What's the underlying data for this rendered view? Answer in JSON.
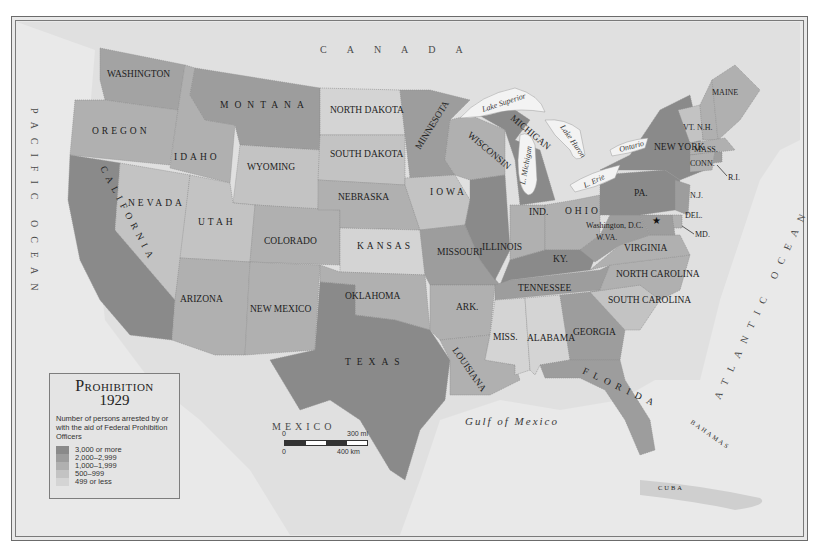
{
  "legend": {
    "title": "Prohibition",
    "year": "1929",
    "description": "Number of persons arrested by or with the aid of Federal Prohibition Officers",
    "categories": [
      {
        "label": "3,000 or more",
        "color": "#8a8a8a"
      },
      {
        "label": "2,000–2,999",
        "color": "#9d9d9d"
      },
      {
        "label": "1,000–1,999",
        "color": "#b0b0b0"
      },
      {
        "label": "500–999",
        "color": "#c3c3c3"
      },
      {
        "label": "499 or less",
        "color": "#d4d4d4"
      }
    ]
  },
  "scale_bar": {
    "mi_zero": "0",
    "mi_label": "300 mi",
    "km_zero": "0",
    "km_label": "400 km"
  },
  "regions": {
    "canada": "CANADA",
    "mexico": "MEXICO",
    "pacific": "PACIFIC OCEAN",
    "atlantic": "ATLANTIC OCEAN",
    "gulf": "Gulf of Mexico",
    "bahamas": "BAHAMAS",
    "cuba": "CUBA"
  },
  "lakes": {
    "superior": "Lake Superior",
    "michigan": "L. Michigan",
    "huron": "Lake Huron",
    "erie": "L. Erie",
    "ontario": "Ontario"
  },
  "states": {
    "washington": {
      "label": "WASHINGTON",
      "category": "2,000–2,999"
    },
    "oregon": {
      "label": "OREGON",
      "category": "1,000–1,999"
    },
    "california": {
      "label": "CALIFORNIA",
      "category": "3,000 or more"
    },
    "idaho": {
      "label": "IDAHO",
      "category": "1,000–1,999"
    },
    "nevada": {
      "label": "NEVADA",
      "category": "500–999"
    },
    "montana": {
      "label": "MONTANA",
      "category": "2,000–2,999"
    },
    "wyoming": {
      "label": "WYOMING",
      "category": "500–999"
    },
    "utah": {
      "label": "UTAH",
      "category": "500–999"
    },
    "arizona": {
      "label": "ARIZONA",
      "category": "1,000–1,999"
    },
    "colorado": {
      "label": "COLORADO",
      "category": "1,000–1,999"
    },
    "new_mexico": {
      "label": "NEW MEXICO",
      "category": "1,000–1,999"
    },
    "north_dakota": {
      "label": "NORTH DAKOTA",
      "category": "499 or less"
    },
    "south_dakota": {
      "label": "SOUTH DAKOTA",
      "category": "500–999"
    },
    "nebraska": {
      "label": "NEBRASKA",
      "category": "1,000–1,999"
    },
    "kansas": {
      "label": "KANSAS",
      "category": "499 or less"
    },
    "oklahoma": {
      "label": "OKLAHOMA",
      "category": "1,000–1,999"
    },
    "texas": {
      "label": "TEXAS",
      "category": "3,000 or more"
    },
    "minnesota": {
      "label": "MINNESOTA",
      "category": "2,000–2,999"
    },
    "iowa": {
      "label": "IOWA",
      "category": "500–999"
    },
    "missouri": {
      "label": "MISSOURI",
      "category": "2,000–2,999"
    },
    "arkansas": {
      "label": "ARK.",
      "category": "1,000–1,999"
    },
    "louisiana": {
      "label": "LOUISIANA",
      "category": "1,000–1,999"
    },
    "wisconsin": {
      "label": "WISCONSIN",
      "category": "1,000–1,999"
    },
    "illinois": {
      "label": "ILLINOIS",
      "category": "3,000 or more"
    },
    "michigan": {
      "label": "MICHIGAN",
      "category": "3,000 or more"
    },
    "indiana": {
      "label": "IND.",
      "category": "1,000–1,999"
    },
    "ohio": {
      "label": "OHIO",
      "category": "1,000–1,999"
    },
    "kentucky": {
      "label": "KY.",
      "category": "3,000 or more"
    },
    "tennessee": {
      "label": "TENNESSEE",
      "category": "2,000–2,999"
    },
    "mississippi": {
      "label": "MISS.",
      "category": "499 or less"
    },
    "alabama": {
      "label": "ALABAMA",
      "category": "499 or less"
    },
    "georgia": {
      "label": "GEORGIA",
      "category": "2,000–2,999"
    },
    "florida": {
      "label": "FLORIDA",
      "category": "2,000–2,999"
    },
    "south_carolina": {
      "label": "SOUTH CAROLINA",
      "category": "500–999"
    },
    "north_carolina": {
      "label": "NORTH CAROLINA",
      "category": "1,000–1,999"
    },
    "virginia": {
      "label": "VIRGINIA",
      "category": "1,000–1,999"
    },
    "west_virginia": {
      "label": "W.VA.",
      "category": "2,000–2,999"
    },
    "pennsylvania": {
      "label": "PA.",
      "category": "3,000 or more"
    },
    "new_york": {
      "label": "NEW YORK",
      "category": "3,000 or more"
    },
    "new_jersey": {
      "label": "N.J.",
      "category": "2,000–2,999"
    },
    "delaware": {
      "label": "DEL.",
      "category": "1,000–1,999"
    },
    "maryland": {
      "label": "MD.",
      "category": "2,000–2,999"
    },
    "vermont": {
      "label": "VT.",
      "category": "500–999"
    },
    "new_hampshire": {
      "label": "N.H.",
      "category": "1,000–1,999"
    },
    "maine": {
      "label": "MAINE",
      "category": "1,000–1,999"
    },
    "massachusetts": {
      "label": "MASS.",
      "category": "1,000–1,999"
    },
    "connecticut": {
      "label": "CONN.",
      "category": "1,000–1,999"
    },
    "rhode_island": {
      "label": "R.I.",
      "category": "2,000–2,999"
    },
    "dc": {
      "label": "Washington, D.C.",
      "category": "2,000–2,999"
    }
  }
}
